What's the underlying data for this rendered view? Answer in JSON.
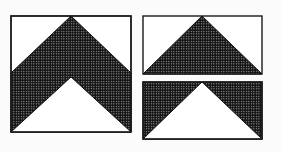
{
  "figure": {
    "colors": {
      "background": "#fbfbfb",
      "outline": "#1a1a1a",
      "hatch": "#111111",
      "white": "#ffffff"
    },
    "left_block": {
      "name": "chevron-square",
      "x": 11,
      "y": 16,
      "w": 120,
      "h": 116,
      "shoulder_y": 73,
      "inner_apex_y": 77
    },
    "right_top_block": {
      "name": "top-triangle-rect",
      "x": 143,
      "y": 16,
      "w": 119,
      "h": 58
    },
    "right_bottom_block": {
      "name": "bottom-inverted-rect",
      "x": 143,
      "y": 82,
      "w": 119,
      "h": 57
    }
  }
}
